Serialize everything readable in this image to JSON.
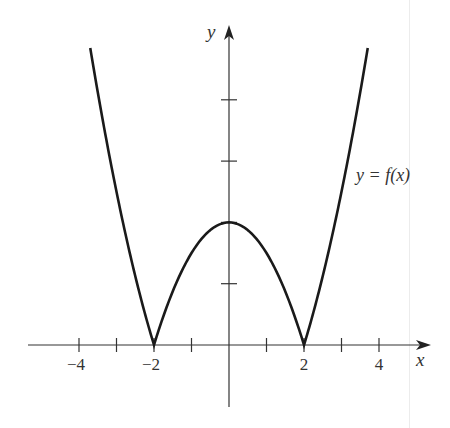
{
  "chart_data": {
    "type": "line",
    "title": "",
    "function_label": "y = f(x)",
    "xlabel": "x",
    "ylabel": "y",
    "xlim": [
      -5.3,
      5.4
    ],
    "ylim": [
      -1,
      5.2
    ],
    "x_ticks": [
      -4,
      -3,
      -2,
      -1,
      1,
      2,
      3,
      4
    ],
    "x_tick_labels": [
      "-4",
      "-2",
      "2",
      "4"
    ],
    "x_tick_label_values": [
      -4,
      -2,
      2,
      4
    ],
    "y_ticks": [
      1,
      2,
      3,
      4
    ],
    "y_tick_labels": [],
    "grid": false,
    "legend": "none",
    "series": [
      {
        "name": "y = f(x)",
        "description": "f(x) = |x^2 - 4| / 2, cusps at x = -2 and x = 2, local max at (0, 2)",
        "x": [
          -3.7,
          -3.5,
          -3,
          -2.5,
          -2,
          -1.5,
          -1,
          -0.5,
          0,
          0.5,
          1,
          1.5,
          2,
          2.5,
          3,
          3.5,
          3.7
        ],
        "y": [
          4.85,
          4.13,
          2.5,
          1.13,
          0,
          0.88,
          1.5,
          1.88,
          2,
          1.88,
          1.5,
          0.88,
          0,
          1.13,
          2.5,
          4.13,
          4.85
        ]
      }
    ],
    "key_points": [
      {
        "label": "cusp",
        "x": -2,
        "y": 0
      },
      {
        "label": "local max",
        "x": 0,
        "y": 2
      },
      {
        "label": "cusp",
        "x": 2,
        "y": 0
      }
    ]
  },
  "labels": {
    "x_axis": "x",
    "y_axis": "y",
    "curve": "y = f(x)",
    "ticks": [
      "−4",
      "−2",
      "2",
      "4"
    ]
  }
}
